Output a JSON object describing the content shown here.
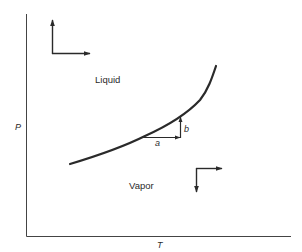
{
  "diagram": {
    "type": "phase-diagram",
    "axes": {
      "y_label": "P",
      "x_label": "T"
    },
    "regions": {
      "upper": "Liquid",
      "lower": "Vapor"
    },
    "coexistence_curve": {
      "description": "liquid-vapor coexistence curve",
      "points": [
        [
          70,
          164
        ],
        [
          140,
          137
        ],
        [
          176,
          120
        ],
        [
          200,
          98
        ],
        [
          216,
          66
        ]
      ]
    },
    "step_vectors": {
      "a": "a",
      "b": "b"
    },
    "direction_indicators": [
      {
        "region": "Liquid",
        "arrows": [
          "up",
          "right"
        ]
      },
      {
        "region": "Vapor",
        "arrows": [
          "down",
          "right"
        ]
      }
    ],
    "colors": {
      "line": "#2a2a2a",
      "background": "#ffffff"
    }
  }
}
